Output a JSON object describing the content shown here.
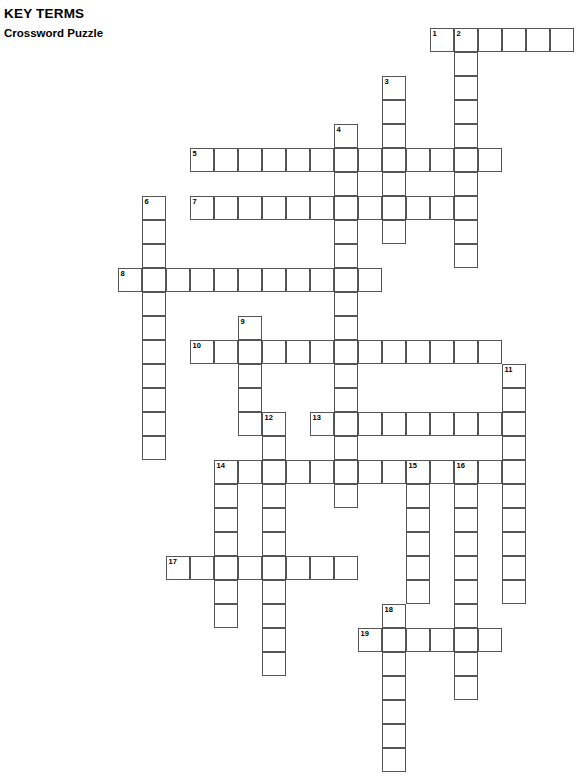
{
  "header": {
    "kicker": "KEY TERMS",
    "subtitle": "Crossword Puzzle"
  },
  "puzzle": {
    "type": "crossword-grid",
    "cell_size_px": 24,
    "origin_x_px": 118,
    "origin_y_px": 28,
    "columns": 20,
    "rows": 31,
    "border_color": "#555555",
    "cell_fill": "#ffffff",
    "number_count": 19,
    "entries": [
      {
        "number": 1,
        "direction": "across",
        "col": 12,
        "row": 0,
        "length": 6
      },
      {
        "number": 2,
        "direction": "down",
        "col": 14,
        "row": 0,
        "length": 10
      },
      {
        "number": 3,
        "direction": "down",
        "col": 11,
        "row": 2,
        "length": 8
      },
      {
        "number": 4,
        "direction": "down",
        "col": 9,
        "row": 4,
        "length": 16
      },
      {
        "number": 5,
        "direction": "across",
        "col": 3,
        "row": 5,
        "length": 13
      },
      {
        "number": 6,
        "direction": "down",
        "col": 1,
        "row": 7,
        "length": 10
      },
      {
        "number": 7,
        "direction": "across",
        "col": 3,
        "row": 7,
        "length": 11
      },
      {
        "number": 8,
        "direction": "across",
        "col": 0,
        "row": 10,
        "length": 11
      },
      {
        "number": 9,
        "direction": "down",
        "col": 5,
        "row": 12,
        "length": 5
      },
      {
        "number": 10,
        "direction": "across",
        "col": 3,
        "row": 13,
        "length": 13
      },
      {
        "number": 11,
        "direction": "down",
        "col": 16,
        "row": 14,
        "length": 9
      },
      {
        "number": 12,
        "direction": "down",
        "col": 6,
        "row": 16,
        "length": 11
      },
      {
        "number": 13,
        "direction": "across",
        "col": 8,
        "row": 16,
        "length": 9
      },
      {
        "number": 14,
        "direction": "down",
        "col": 4,
        "row": 18,
        "length": 7
      },
      {
        "number": 14,
        "direction": "across",
        "col": 4,
        "row": 18,
        "length": 13
      },
      {
        "number": 15,
        "direction": "down",
        "col": 12,
        "row": 18,
        "length": 8
      },
      {
        "number": 16,
        "direction": "down",
        "col": 14,
        "row": 18,
        "length": 13
      },
      {
        "number": 17,
        "direction": "across",
        "col": 2,
        "row": 22,
        "length": 8
      },
      {
        "number": 18,
        "direction": "down",
        "col": 11,
        "row": 24,
        "length": 7
      },
      {
        "number": 19,
        "direction": "across",
        "col": 10,
        "row": 25,
        "length": 6
      }
    ],
    "cells": [
      {
        "c": 13,
        "r": 0,
        "n": 1
      },
      {
        "c": 14,
        "r": 0,
        "n": 2
      },
      {
        "c": 15,
        "r": 0
      },
      {
        "c": 16,
        "r": 0
      },
      {
        "c": 17,
        "r": 0
      },
      {
        "c": 18,
        "r": 0
      },
      {
        "c": 14,
        "r": 1
      },
      {
        "c": 11,
        "r": 2,
        "n": 3
      },
      {
        "c": 14,
        "r": 2
      },
      {
        "c": 11,
        "r": 3
      },
      {
        "c": 14,
        "r": 3
      },
      {
        "c": 9,
        "r": 4,
        "n": 4
      },
      {
        "c": 11,
        "r": 4
      },
      {
        "c": 14,
        "r": 4
      },
      {
        "c": 3,
        "r": 5,
        "n": 5
      },
      {
        "c": 4,
        "r": 5
      },
      {
        "c": 5,
        "r": 5
      },
      {
        "c": 6,
        "r": 5
      },
      {
        "c": 7,
        "r": 5
      },
      {
        "c": 8,
        "r": 5
      },
      {
        "c": 9,
        "r": 5
      },
      {
        "c": 10,
        "r": 5
      },
      {
        "c": 11,
        "r": 5
      },
      {
        "c": 12,
        "r": 5
      },
      {
        "c": 13,
        "r": 5
      },
      {
        "c": 14,
        "r": 5
      },
      {
        "c": 15,
        "r": 5
      },
      {
        "c": 9,
        "r": 6
      },
      {
        "c": 11,
        "r": 6
      },
      {
        "c": 14,
        "r": 6
      },
      {
        "c": 1,
        "r": 7,
        "n": 6
      },
      {
        "c": 3,
        "r": 7,
        "n": 7
      },
      {
        "c": 4,
        "r": 7
      },
      {
        "c": 5,
        "r": 7
      },
      {
        "c": 6,
        "r": 7
      },
      {
        "c": 7,
        "r": 7
      },
      {
        "c": 8,
        "r": 7
      },
      {
        "c": 9,
        "r": 7
      },
      {
        "c": 10,
        "r": 7
      },
      {
        "c": 11,
        "r": 7
      },
      {
        "c": 12,
        "r": 7
      },
      {
        "c": 13,
        "r": 7
      },
      {
        "c": 14,
        "r": 7
      },
      {
        "c": 1,
        "r": 8
      },
      {
        "c": 9,
        "r": 8
      },
      {
        "c": 11,
        "r": 8
      },
      {
        "c": 14,
        "r": 8
      },
      {
        "c": 1,
        "r": 9
      },
      {
        "c": 9,
        "r": 9
      },
      {
        "c": 14,
        "r": 9
      },
      {
        "c": 0,
        "r": 10,
        "n": 8
      },
      {
        "c": 1,
        "r": 10
      },
      {
        "c": 2,
        "r": 10
      },
      {
        "c": 3,
        "r": 10
      },
      {
        "c": 4,
        "r": 10
      },
      {
        "c": 5,
        "r": 10
      },
      {
        "c": 6,
        "r": 10
      },
      {
        "c": 7,
        "r": 10
      },
      {
        "c": 8,
        "r": 10
      },
      {
        "c": 9,
        "r": 10
      },
      {
        "c": 10,
        "r": 10
      },
      {
        "c": 1,
        "r": 11
      },
      {
        "c": 9,
        "r": 11
      },
      {
        "c": 1,
        "r": 12
      },
      {
        "c": 5,
        "r": 12,
        "n": 9
      },
      {
        "c": 9,
        "r": 12
      },
      {
        "c": 1,
        "r": 13
      },
      {
        "c": 3,
        "r": 13,
        "n": 10
      },
      {
        "c": 4,
        "r": 13
      },
      {
        "c": 5,
        "r": 13
      },
      {
        "c": 6,
        "r": 13
      },
      {
        "c": 7,
        "r": 13
      },
      {
        "c": 8,
        "r": 13
      },
      {
        "c": 9,
        "r": 13
      },
      {
        "c": 10,
        "r": 13
      },
      {
        "c": 11,
        "r": 13
      },
      {
        "c": 12,
        "r": 13
      },
      {
        "c": 13,
        "r": 13
      },
      {
        "c": 14,
        "r": 13
      },
      {
        "c": 15,
        "r": 13
      },
      {
        "c": 1,
        "r": 14
      },
      {
        "c": 5,
        "r": 14
      },
      {
        "c": 9,
        "r": 14
      },
      {
        "c": 16,
        "r": 14,
        "n": 11
      },
      {
        "c": 1,
        "r": 15
      },
      {
        "c": 5,
        "r": 15
      },
      {
        "c": 9,
        "r": 15
      },
      {
        "c": 16,
        "r": 15
      },
      {
        "c": 1,
        "r": 16
      },
      {
        "c": 5,
        "r": 16
      },
      {
        "c": 6,
        "r": 16,
        "n": 12
      },
      {
        "c": 8,
        "r": 16,
        "n": 13
      },
      {
        "c": 9,
        "r": 16
      },
      {
        "c": 10,
        "r": 16
      },
      {
        "c": 11,
        "r": 16
      },
      {
        "c": 12,
        "r": 16
      },
      {
        "c": 13,
        "r": 16
      },
      {
        "c": 14,
        "r": 16
      },
      {
        "c": 15,
        "r": 16
      },
      {
        "c": 16,
        "r": 16
      },
      {
        "c": 1,
        "r": 17
      },
      {
        "c": 6,
        "r": 17
      },
      {
        "c": 9,
        "r": 17
      },
      {
        "c": 16,
        "r": 17
      },
      {
        "c": 4,
        "r": 18,
        "n": 14
      },
      {
        "c": 5,
        "r": 18
      },
      {
        "c": 6,
        "r": 18
      },
      {
        "c": 7,
        "r": 18
      },
      {
        "c": 8,
        "r": 18
      },
      {
        "c": 9,
        "r": 18
      },
      {
        "c": 10,
        "r": 18
      },
      {
        "c": 11,
        "r": 18
      },
      {
        "c": 12,
        "r": 18,
        "n": 15
      },
      {
        "c": 13,
        "r": 18
      },
      {
        "c": 14,
        "r": 18,
        "n": 16
      },
      {
        "c": 15,
        "r": 18
      },
      {
        "c": 16,
        "r": 18
      },
      {
        "c": 4,
        "r": 19
      },
      {
        "c": 6,
        "r": 19
      },
      {
        "c": 9,
        "r": 19
      },
      {
        "c": 12,
        "r": 19
      },
      {
        "c": 14,
        "r": 19
      },
      {
        "c": 16,
        "r": 19
      },
      {
        "c": 4,
        "r": 20
      },
      {
        "c": 6,
        "r": 20
      },
      {
        "c": 12,
        "r": 20
      },
      {
        "c": 14,
        "r": 20
      },
      {
        "c": 16,
        "r": 20
      },
      {
        "c": 4,
        "r": 21
      },
      {
        "c": 6,
        "r": 21
      },
      {
        "c": 12,
        "r": 21
      },
      {
        "c": 14,
        "r": 21
      },
      {
        "c": 16,
        "r": 21
      },
      {
        "c": 2,
        "r": 22,
        "n": 17
      },
      {
        "c": 3,
        "r": 22
      },
      {
        "c": 4,
        "r": 22
      },
      {
        "c": 5,
        "r": 22
      },
      {
        "c": 6,
        "r": 22
      },
      {
        "c": 7,
        "r": 22
      },
      {
        "c": 8,
        "r": 22
      },
      {
        "c": 9,
        "r": 22
      },
      {
        "c": 12,
        "r": 22
      },
      {
        "c": 14,
        "r": 22
      },
      {
        "c": 16,
        "r": 22
      },
      {
        "c": 4,
        "r": 23
      },
      {
        "c": 6,
        "r": 23
      },
      {
        "c": 12,
        "r": 23
      },
      {
        "c": 14,
        "r": 23
      },
      {
        "c": 16,
        "r": 23
      },
      {
        "c": 4,
        "r": 24
      },
      {
        "c": 6,
        "r": 24
      },
      {
        "c": 11,
        "r": 24,
        "n": 18
      },
      {
        "c": 14,
        "r": 24
      },
      {
        "c": 6,
        "r": 25
      },
      {
        "c": 10,
        "r": 25,
        "n": 19
      },
      {
        "c": 11,
        "r": 25
      },
      {
        "c": 12,
        "r": 25
      },
      {
        "c": 13,
        "r": 25
      },
      {
        "c": 14,
        "r": 25
      },
      {
        "c": 15,
        "r": 25
      },
      {
        "c": 6,
        "r": 26
      },
      {
        "c": 11,
        "r": 26
      },
      {
        "c": 14,
        "r": 26
      },
      {
        "c": 11,
        "r": 27
      },
      {
        "c": 14,
        "r": 27
      },
      {
        "c": 11,
        "r": 28
      },
      {
        "c": 11,
        "r": 29
      },
      {
        "c": 11,
        "r": 30
      }
    ]
  }
}
